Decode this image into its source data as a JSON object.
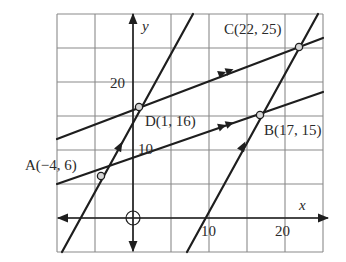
{
  "figure": {
    "axes": {
      "x_label": "x",
      "y_label": "y",
      "x_ticks": [
        {
          "value": 10,
          "label": "10"
        },
        {
          "value": 20,
          "label": "20"
        }
      ],
      "y_ticks": [
        {
          "value": 10,
          "label": "10"
        },
        {
          "value": 20,
          "label": "20"
        }
      ],
      "origin_marker": "circle-crosshair",
      "grid_step": 5,
      "x_range": [
        -15,
        25
      ],
      "y_range": [
        -5,
        30
      ]
    },
    "points": [
      {
        "name": "A",
        "label": "A(−4, 6)",
        "x": -4,
        "y": 6
      },
      {
        "name": "B",
        "label": "B(17, 15)",
        "x": 17,
        "y": 15
      },
      {
        "name": "C",
        "label": "C(22, 25)",
        "x": 22,
        "y": 25
      },
      {
        "name": "D",
        "label": "D(1, 16)",
        "x": 1,
        "y": 16
      }
    ],
    "lines": [
      {
        "name": "line-DC",
        "through": [
          "D",
          "C"
        ],
        "arrow_marks": 2
      },
      {
        "name": "line-AB",
        "through": [
          "A",
          "B"
        ],
        "arrow_marks": 2
      },
      {
        "name": "line-AD",
        "through": [
          "A",
          "D"
        ],
        "arrow_marks": 1
      },
      {
        "name": "line-BC",
        "through": [
          "B",
          "C"
        ],
        "arrow_marks": 1
      }
    ],
    "colors": {
      "line": "#1e1e1e",
      "grid": "#8a8a8a",
      "point_fill": "#d8d8d8",
      "text": "#2a2a2a"
    }
  }
}
